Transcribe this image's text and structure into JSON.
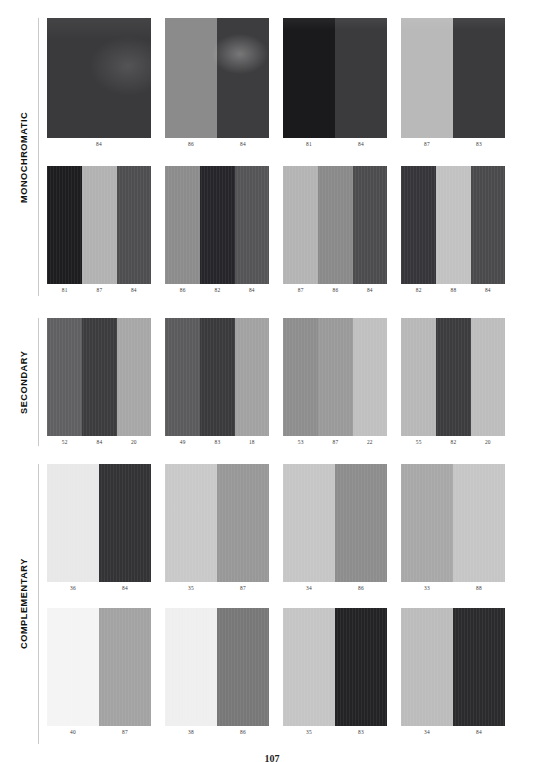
{
  "page": {
    "number": "107",
    "background": "#ffffff"
  },
  "sections": [
    {
      "id": "monochromatic",
      "label": "MONOCHROMATIC",
      "top": 18,
      "height": 290,
      "rule": {
        "top": 18,
        "height": 278
      },
      "rows": [
        {
          "top": 0,
          "cards": [
            {
              "name": "swatch-mono-1",
              "width": 104,
              "height": 120,
              "gap": 14,
              "sheen": "v1",
              "bands": [
                {
                  "color": "#3a3a3c",
                  "width": 100
                }
              ],
              "labels": [
                "84"
              ]
            },
            {
              "name": "swatch-mono-2",
              "width": 104,
              "height": 120,
              "gap": 14,
              "sheen": "v2",
              "bands": [
                {
                  "color": "#8b8b8b",
                  "width": 50
                },
                {
                  "color": "#3d3d3f",
                  "width": 50
                }
              ],
              "labels": [
                "86",
                "84"
              ]
            },
            {
              "name": "swatch-mono-3",
              "width": 104,
              "height": 120,
              "gap": 14,
              "sheen": "v3",
              "bands": [
                {
                  "color": "#1a1a1c",
                  "width": 50
                },
                {
                  "color": "#3b3b3d",
                  "width": 50
                }
              ],
              "labels": [
                "81",
                "84"
              ]
            },
            {
              "name": "swatch-mono-4",
              "width": 104,
              "height": 120,
              "gap": 0,
              "sheen": "v3",
              "bands": [
                {
                  "color": "#b9b9b9",
                  "width": 50
                },
                {
                  "color": "#3b3b3d",
                  "width": 50
                }
              ],
              "labels": [
                "87",
                "83"
              ]
            }
          ]
        },
        {
          "top": 148,
          "cards": [
            {
              "name": "swatch-mono-5",
              "width": 104,
              "height": 118,
              "gap": 14,
              "sheen": "fine",
              "bands": [
                {
                  "color": "#1d1d1f",
                  "width": 34
                },
                {
                  "color": "#b2b2b2",
                  "width": 33
                },
                {
                  "color": "#4e4e50",
                  "width": 33
                }
              ],
              "labels": [
                "81",
                "87",
                "84"
              ]
            },
            {
              "name": "swatch-mono-6",
              "width": 104,
              "height": 118,
              "gap": 14,
              "sheen": "fine",
              "bands": [
                {
                  "color": "#8c8c8c",
                  "width": 34
                },
                {
                  "color": "#26262a",
                  "width": 33
                },
                {
                  "color": "#555557",
                  "width": 33
                }
              ],
              "labels": [
                "86",
                "82",
                "84"
              ]
            },
            {
              "name": "swatch-mono-7",
              "width": 104,
              "height": 118,
              "gap": 14,
              "sheen": "fine",
              "bands": [
                {
                  "color": "#b4b4b4",
                  "width": 34
                },
                {
                  "color": "#8a8a8a",
                  "width": 33
                },
                {
                  "color": "#4c4c4e",
                  "width": 33
                }
              ],
              "labels": [
                "87",
                "86",
                "84"
              ]
            },
            {
              "name": "swatch-mono-8",
              "width": 104,
              "height": 118,
              "gap": 0,
              "sheen": "fine",
              "bands": [
                {
                  "color": "#36363a",
                  "width": 34
                },
                {
                  "color": "#c2c2c2",
                  "width": 33
                },
                {
                  "color": "#4a4a4c",
                  "width": 33
                }
              ],
              "labels": [
                "82",
                "88",
                "84"
              ]
            }
          ]
        }
      ]
    },
    {
      "id": "secondary",
      "label": "SECONDARY",
      "top": 318,
      "height": 140,
      "rule": {
        "top": 318,
        "height": 128
      },
      "rows": [
        {
          "top": 0,
          "cards": [
            {
              "name": "swatch-sec-1",
              "width": 104,
              "height": 118,
              "gap": 14,
              "sheen": "fine",
              "bands": [
                {
                  "color": "#606062",
                  "width": 34
                },
                {
                  "color": "#3c3c3e",
                  "width": 33
                },
                {
                  "color": "#a7a7a7",
                  "width": 33
                }
              ],
              "labels": [
                "52",
                "84",
                "20"
              ]
            },
            {
              "name": "swatch-sec-2",
              "width": 104,
              "height": 118,
              "gap": 14,
              "sheen": "fine",
              "bands": [
                {
                  "color": "#5b5b5d",
                  "width": 34
                },
                {
                  "color": "#3a3a3c",
                  "width": 33
                },
                {
                  "color": "#a2a2a2",
                  "width": 33
                }
              ],
              "labels": [
                "49",
                "83",
                "18"
              ]
            },
            {
              "name": "swatch-sec-3",
              "width": 104,
              "height": 118,
              "gap": 14,
              "sheen": "fine",
              "bands": [
                {
                  "color": "#8e8e8e",
                  "width": 34
                },
                {
                  "color": "#9a9a9a",
                  "width": 33
                },
                {
                  "color": "#c0c0c0",
                  "width": 33
                }
              ],
              "labels": [
                "53",
                "87",
                "22"
              ]
            },
            {
              "name": "swatch-sec-4",
              "width": 104,
              "height": 118,
              "gap": 0,
              "sheen": "fine",
              "bands": [
                {
                  "color": "#b8b8b8",
                  "width": 34
                },
                {
                  "color": "#3c3c3e",
                  "width": 33
                },
                {
                  "color": "#bdbdbd",
                  "width": 33
                }
              ],
              "labels": [
                "55",
                "82",
                "20"
              ]
            }
          ]
        }
      ]
    },
    {
      "id": "complementary",
      "label": "COMPLEMENTARY",
      "top": 464,
      "height": 290,
      "rule": {
        "top": 464,
        "height": 280
      },
      "rows": [
        {
          "top": 0,
          "cards": [
            {
              "name": "swatch-comp-1",
              "width": 104,
              "height": 118,
              "gap": 14,
              "sheen": "fine",
              "bands": [
                {
                  "color": "#e8e8e8",
                  "width": 50
                },
                {
                  "color": "#333335",
                  "width": 50
                }
              ],
              "labels": [
                "36",
                "84"
              ]
            },
            {
              "name": "swatch-comp-2",
              "width": 104,
              "height": 118,
              "gap": 14,
              "sheen": "fine",
              "bands": [
                {
                  "color": "#c9c9c9",
                  "width": 50
                },
                {
                  "color": "#989898",
                  "width": 50
                }
              ],
              "labels": [
                "35",
                "87"
              ]
            },
            {
              "name": "swatch-comp-3",
              "width": 104,
              "height": 118,
              "gap": 14,
              "sheen": "fine",
              "bands": [
                {
                  "color": "#c6c6c6",
                  "width": 50
                },
                {
                  "color": "#8d8d8d",
                  "width": 50
                }
              ],
              "labels": [
                "34",
                "86"
              ]
            },
            {
              "name": "swatch-comp-4",
              "width": 104,
              "height": 118,
              "gap": 0,
              "sheen": "fine",
              "bands": [
                {
                  "color": "#a8a8a8",
                  "width": 50
                },
                {
                  "color": "#c6c6c6",
                  "width": 50
                }
              ],
              "labels": [
                "33",
                "88"
              ]
            }
          ]
        },
        {
          "top": 144,
          "cards": [
            {
              "name": "swatch-comp-5",
              "width": 104,
              "height": 118,
              "gap": 14,
              "sheen": "fine",
              "bands": [
                {
                  "color": "#f4f4f4",
                  "width": 50
                },
                {
                  "color": "#a3a3a3",
                  "width": 50
                }
              ],
              "labels": [
                "40",
                "87"
              ]
            },
            {
              "name": "swatch-comp-6",
              "width": 104,
              "height": 118,
              "gap": 14,
              "sheen": "fine",
              "bands": [
                {
                  "color": "#efefef",
                  "width": 50
                },
                {
                  "color": "#787878",
                  "width": 50
                }
              ],
              "labels": [
                "38",
                "86"
              ]
            },
            {
              "name": "swatch-comp-7",
              "width": 104,
              "height": 118,
              "gap": 14,
              "sheen": "fine",
              "bands": [
                {
                  "color": "#c5c5c5",
                  "width": 50
                },
                {
                  "color": "#232325",
                  "width": 50
                }
              ],
              "labels": [
                "35",
                "83"
              ]
            },
            {
              "name": "swatch-comp-8",
              "width": 104,
              "height": 118,
              "gap": 0,
              "sheen": "fine",
              "bands": [
                {
                  "color": "#bcbcbc",
                  "width": 50
                },
                {
                  "color": "#2b2b2d",
                  "width": 50
                }
              ],
              "labels": [
                "34",
                "84"
              ]
            }
          ]
        }
      ]
    }
  ],
  "chart_data": {
    "type": "table",
    "columns": [
      "category",
      "swatch",
      "band_values"
    ],
    "rows": [
      {
        "category": "MONOCHROMATIC",
        "swatch": 1,
        "band_values": [
          "84"
        ]
      },
      {
        "category": "MONOCHROMATIC",
        "swatch": 2,
        "band_values": [
          "86",
          "84"
        ]
      },
      {
        "category": "MONOCHROMATIC",
        "swatch": 3,
        "band_values": [
          "81",
          "84"
        ]
      },
      {
        "category": "MONOCHROMATIC",
        "swatch": 4,
        "band_values": [
          "87",
          "83"
        ]
      },
      {
        "category": "MONOCHROMATIC",
        "swatch": 5,
        "band_values": [
          "81",
          "87",
          "84"
        ]
      },
      {
        "category": "MONOCHROMATIC",
        "swatch": 6,
        "band_values": [
          "86",
          "82",
          "84"
        ]
      },
      {
        "category": "MONOCHROMATIC",
        "swatch": 7,
        "band_values": [
          "87",
          "86",
          "84"
        ]
      },
      {
        "category": "MONOCHROMATIC",
        "swatch": 8,
        "band_values": [
          "82",
          "88",
          "84"
        ]
      },
      {
        "category": "SECONDARY",
        "swatch": 1,
        "band_values": [
          "52",
          "84",
          "20"
        ]
      },
      {
        "category": "SECONDARY",
        "swatch": 2,
        "band_values": [
          "49",
          "83",
          "18"
        ]
      },
      {
        "category": "SECONDARY",
        "swatch": 3,
        "band_values": [
          "53",
          "87",
          "22"
        ]
      },
      {
        "category": "SECONDARY",
        "swatch": 4,
        "band_values": [
          "55",
          "82",
          "20"
        ]
      },
      {
        "category": "COMPLEMENTARY",
        "swatch": 1,
        "band_values": [
          "36",
          "84"
        ]
      },
      {
        "category": "COMPLEMENTARY",
        "swatch": 2,
        "band_values": [
          "35",
          "87"
        ]
      },
      {
        "category": "COMPLEMENTARY",
        "swatch": 3,
        "band_values": [
          "34",
          "86"
        ]
      },
      {
        "category": "COMPLEMENTARY",
        "swatch": 4,
        "band_values": [
          "33",
          "88"
        ]
      },
      {
        "category": "COMPLEMENTARY",
        "swatch": 5,
        "band_values": [
          "40",
          "87"
        ]
      },
      {
        "category": "COMPLEMENTARY",
        "swatch": 6,
        "band_values": [
          "38",
          "86"
        ]
      },
      {
        "category": "COMPLEMENTARY",
        "swatch": 7,
        "band_values": [
          "35",
          "83"
        ]
      },
      {
        "category": "COMPLEMENTARY",
        "swatch": 8,
        "band_values": [
          "34",
          "84"
        ]
      }
    ]
  }
}
